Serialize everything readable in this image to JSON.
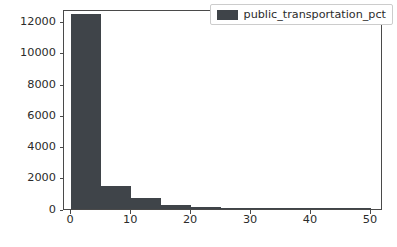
{
  "chart_data": {
    "type": "bar",
    "title": "",
    "subtitle": "",
    "xlabel": "",
    "ylabel": "Frequency",
    "xlim": [
      -1.2,
      52.0
    ],
    "ylim": [
      0,
      12800
    ],
    "grid": false,
    "legend_position": "upper right",
    "bin_width": 5,
    "bin_edges": [
      0,
      5,
      10,
      15,
      20,
      25,
      30,
      35,
      40,
      45,
      50
    ],
    "categories": [
      "0-5",
      "5-10",
      "10-15",
      "15-20",
      "20-25",
      "25-30",
      "30-35",
      "35-40",
      "40-45",
      "45-50"
    ],
    "x": [
      2.5,
      7.5,
      12.5,
      17.5,
      22.5,
      27.5,
      32.5,
      37.5,
      42.5,
      47.5
    ],
    "values": [
      12450,
      1500,
      700,
      270,
      120,
      60,
      28,
      14,
      8,
      4
    ],
    "series": [
      {
        "name": "public_transportation_pct",
        "color": "#3f4449",
        "values": [
          12450,
          1500,
          700,
          270,
          120,
          60,
          28,
          14,
          8,
          4
        ]
      }
    ],
    "x_ticks": [
      0,
      10,
      20,
      30,
      40,
      50
    ],
    "x_tick_labels": [
      "0",
      "10",
      "20",
      "30",
      "40",
      "50"
    ],
    "y_ticks": [
      0,
      2000,
      4000,
      6000,
      8000,
      10000,
      12000
    ],
    "y_tick_labels": [
      "0",
      "2000",
      "4000",
      "6000",
      "8000",
      "10000",
      "12000"
    ],
    "legend": [
      {
        "label": "public_transportation_pct",
        "color": "#3f4449"
      }
    ]
  },
  "figure": {
    "background_color": "#ffffff",
    "axes_color": "#4a4a4a",
    "text_color": "#2b2b2b",
    "legend_border_color": "#cccccc"
  }
}
